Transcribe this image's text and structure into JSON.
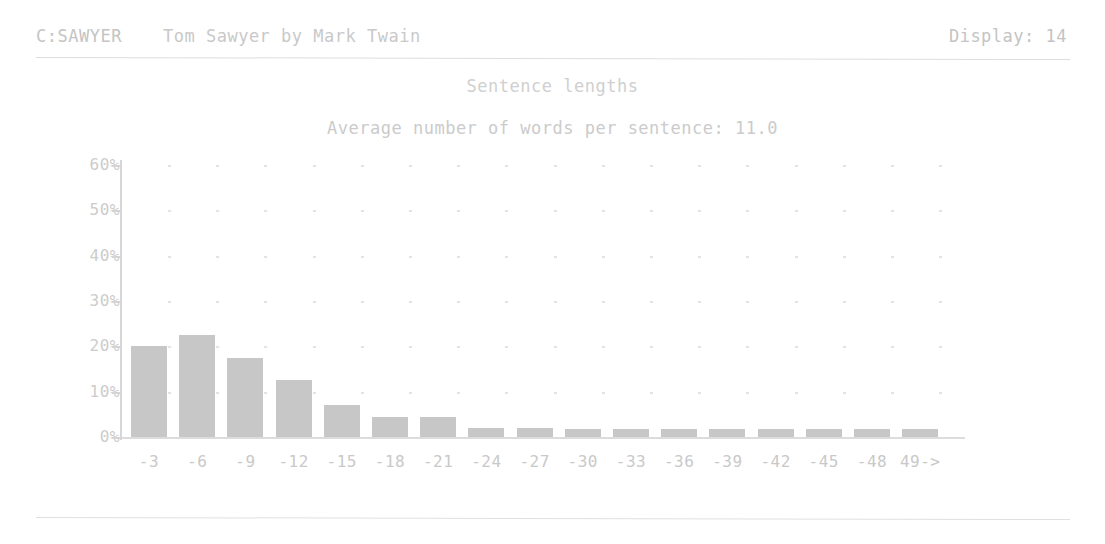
{
  "header": {
    "path": "C:SAWYER",
    "document_title": "Tom Sawyer by Mark Twain",
    "display_label": "Display: 14"
  },
  "chart_data": {
    "type": "bar",
    "title": "Sentence lengths",
    "subtitle": "Average number of words per sentence: 11.0",
    "xlabel": "",
    "ylabel": "",
    "ylim": [
      0,
      60
    ],
    "grid": true,
    "legend": "none",
    "ytick_labels": [
      "0%",
      "10%",
      "20%",
      "30%",
      "40%",
      "50%",
      "60%"
    ],
    "ytick_values": [
      0,
      10,
      20,
      30,
      40,
      50,
      60
    ],
    "categories": [
      "-3",
      "-6",
      "-9",
      "-12",
      "-15",
      "-18",
      "-21",
      "-24",
      "-27",
      "-30",
      "-33",
      "-36",
      "-39",
      "-42",
      "-45",
      "-48",
      "49->"
    ],
    "values": [
      20.0,
      22.5,
      17.5,
      12.5,
      7.0,
      4.5,
      4.5,
      2.0,
      2.0,
      1.8,
      1.8,
      1.8,
      1.8,
      1.8,
      1.8,
      1.8,
      1.8
    ]
  }
}
